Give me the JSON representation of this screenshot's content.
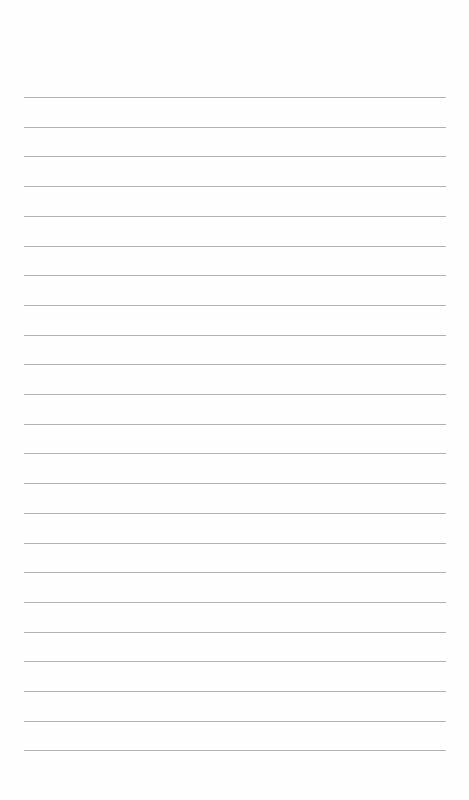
{
  "page": {
    "type": "lined-paper",
    "background_color": "#fefefe",
    "line_color": "#9a9a9a",
    "line_count": 23,
    "first_line_y": 97,
    "line_spacing": 29.7,
    "line_left_x": 24,
    "line_right_x": 446,
    "content": []
  }
}
